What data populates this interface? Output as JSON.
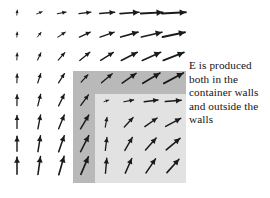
{
  "figure": {
    "name": "electric-field-container-diagram",
    "width": 270,
    "height": 198,
    "background_color": "#ffffff"
  },
  "annotation": {
    "lines": [
      "E is produced",
      "both in the",
      "container walls",
      "and outside the",
      "walls"
    ],
    "full_text": "E is produced both in the container walls and outside the walls",
    "color": "#141414",
    "x": 189,
    "y": 59
  },
  "container": {
    "wall_color": "#b9b9b9",
    "interior_color": "#e2e2e2",
    "wall_rect": {
      "x": 73,
      "y": 71,
      "width": 113,
      "height": 112
    },
    "interior_rect": {
      "x": 95,
      "y": 94,
      "width": 91,
      "height": 89
    },
    "wall_thickness": 22
  },
  "chart_data": {
    "type": "quiver",
    "title": "",
    "xlabel": "",
    "ylabel": "",
    "grid": false,
    "legend": null,
    "arrow_color": "#1a1a1a",
    "source_origin": {
      "x": 13,
      "y": 2,
      "note": "field radiates from point charge near upper-left corner"
    },
    "grid_spacing": {
      "dx": 22.2,
      "dy": 22.2
    },
    "grid_origin": {
      "x": 17,
      "y": 13
    },
    "columns": 8,
    "rows": 8,
    "xlim": [
      0,
      270
    ],
    "ylim": [
      0,
      198
    ],
    "arrows": [
      {
        "col": 0,
        "row": 0,
        "x": 17,
        "y": 13,
        "angle_deg": -84,
        "length": 5
      },
      {
        "col": 1,
        "row": 0,
        "x": 39,
        "y": 13,
        "angle_deg": -22,
        "length": 6
      },
      {
        "col": 2,
        "row": 0,
        "x": 61,
        "y": 13,
        "angle_deg": -11,
        "length": 9
      },
      {
        "col": 3,
        "row": 0,
        "x": 84,
        "y": 13,
        "angle_deg": -7,
        "length": 12
      },
      {
        "col": 4,
        "row": 0,
        "x": 106,
        "y": 13,
        "angle_deg": -5,
        "length": 15
      },
      {
        "col": 5,
        "row": 0,
        "x": 128,
        "y": 13,
        "angle_deg": -4,
        "length": 19
      },
      {
        "col": 6,
        "row": 0,
        "x": 150,
        "y": 13,
        "angle_deg": -3,
        "length": 22
      },
      {
        "col": 7,
        "row": 0,
        "x": 172,
        "y": 13,
        "angle_deg": -3,
        "length": 24
      },
      {
        "col": 0,
        "row": 1,
        "x": 17,
        "y": 35,
        "angle_deg": -86,
        "length": 5
      },
      {
        "col": 1,
        "row": 1,
        "x": 39,
        "y": 35,
        "angle_deg": -52,
        "length": 6
      },
      {
        "col": 2,
        "row": 1,
        "x": 61,
        "y": 35,
        "angle_deg": -34,
        "length": 9
      },
      {
        "col": 3,
        "row": 1,
        "x": 84,
        "y": 35,
        "angle_deg": -25,
        "length": 12
      },
      {
        "col": 4,
        "row": 1,
        "x": 106,
        "y": 35,
        "angle_deg": -19,
        "length": 15
      },
      {
        "col": 5,
        "row": 1,
        "x": 128,
        "y": 35,
        "angle_deg": -16,
        "length": 18
      },
      {
        "col": 6,
        "row": 1,
        "x": 150,
        "y": 35,
        "angle_deg": -13,
        "length": 21
      },
      {
        "col": 7,
        "row": 1,
        "x": 172,
        "y": 35,
        "angle_deg": -12,
        "length": 23
      },
      {
        "col": 0,
        "row": 2,
        "x": 17,
        "y": 57,
        "angle_deg": -87,
        "length": 7
      },
      {
        "col": 1,
        "row": 2,
        "x": 39,
        "y": 57,
        "angle_deg": -65,
        "length": 8
      },
      {
        "col": 2,
        "row": 2,
        "x": 61,
        "y": 57,
        "angle_deg": -49,
        "length": 10
      },
      {
        "col": 3,
        "row": 2,
        "x": 84,
        "y": 57,
        "angle_deg": -39,
        "length": 13
      },
      {
        "col": 4,
        "row": 2,
        "x": 106,
        "y": 57,
        "angle_deg": -32,
        "length": 15
      },
      {
        "col": 5,
        "row": 2,
        "x": 128,
        "y": 57,
        "angle_deg": -27,
        "length": 18
      },
      {
        "col": 6,
        "row": 2,
        "x": 150,
        "y": 57,
        "angle_deg": -24,
        "length": 20
      },
      {
        "col": 7,
        "row": 2,
        "x": 172,
        "y": 57,
        "angle_deg": -21,
        "length": 22
      },
      {
        "col": 0,
        "row": 3,
        "x": 17,
        "y": 79,
        "angle_deg": -88,
        "length": 9
      },
      {
        "col": 1,
        "row": 3,
        "x": 39,
        "y": 79,
        "angle_deg": -72,
        "length": 10
      },
      {
        "col": 2,
        "row": 3,
        "x": 61,
        "y": 79,
        "angle_deg": -58,
        "length": 11
      },
      {
        "col": 3,
        "row": 3,
        "x": 84,
        "y": 79,
        "angle_deg": -47,
        "length": 10
      },
      {
        "col": 4,
        "row": 3,
        "x": 106,
        "y": 79,
        "angle_deg": -40,
        "length": 14
      },
      {
        "col": 5,
        "row": 3,
        "x": 128,
        "y": 79,
        "angle_deg": -35,
        "length": 17
      },
      {
        "col": 6,
        "row": 3,
        "x": 150,
        "y": 79,
        "angle_deg": -31,
        "length": 20
      },
      {
        "col": 7,
        "row": 3,
        "x": 172,
        "y": 79,
        "angle_deg": -28,
        "length": 22
      },
      {
        "col": 0,
        "row": 4,
        "x": 17,
        "y": 101,
        "angle_deg": -89,
        "length": 11
      },
      {
        "col": 1,
        "row": 4,
        "x": 39,
        "y": 101,
        "angle_deg": -76,
        "length": 12
      },
      {
        "col": 2,
        "row": 4,
        "x": 61,
        "y": 101,
        "angle_deg": -64,
        "length": 13
      },
      {
        "col": 3,
        "row": 4,
        "x": 84,
        "y": 101,
        "angle_deg": -54,
        "length": 13
      },
      {
        "col": 4,
        "row": 4,
        "x": 106,
        "y": 101,
        "angle_deg": -18,
        "length": 5
      },
      {
        "col": 5,
        "row": 4,
        "x": 128,
        "y": 101,
        "angle_deg": -11,
        "length": 10
      },
      {
        "col": 6,
        "row": 4,
        "x": 150,
        "y": 101,
        "angle_deg": -7,
        "length": 14
      },
      {
        "col": 7,
        "row": 4,
        "x": 172,
        "y": 101,
        "angle_deg": -5,
        "length": 16
      },
      {
        "col": 0,
        "row": 5,
        "x": 17,
        "y": 123,
        "angle_deg": -90,
        "length": 13
      },
      {
        "col": 1,
        "row": 5,
        "x": 39,
        "y": 123,
        "angle_deg": -79,
        "length": 14
      },
      {
        "col": 2,
        "row": 5,
        "x": 61,
        "y": 123,
        "angle_deg": -68,
        "length": 15
      },
      {
        "col": 3,
        "row": 5,
        "x": 84,
        "y": 123,
        "angle_deg": -59,
        "length": 16
      },
      {
        "col": 4,
        "row": 5,
        "x": 106,
        "y": 123,
        "angle_deg": -80,
        "length": 10
      },
      {
        "col": 5,
        "row": 5,
        "x": 128,
        "y": 123,
        "angle_deg": -47,
        "length": 13
      },
      {
        "col": 6,
        "row": 5,
        "x": 150,
        "y": 123,
        "angle_deg": -35,
        "length": 15
      },
      {
        "col": 7,
        "row": 5,
        "x": 172,
        "y": 123,
        "angle_deg": -28,
        "length": 17
      },
      {
        "col": 0,
        "row": 6,
        "x": 17,
        "y": 145,
        "angle_deg": -90,
        "length": 15
      },
      {
        "col": 1,
        "row": 6,
        "x": 39,
        "y": 145,
        "angle_deg": -81,
        "length": 16
      },
      {
        "col": 2,
        "row": 6,
        "x": 61,
        "y": 145,
        "angle_deg": -71,
        "length": 17
      },
      {
        "col": 3,
        "row": 6,
        "x": 84,
        "y": 145,
        "angle_deg": -63,
        "length": 18
      },
      {
        "col": 4,
        "row": 6,
        "x": 106,
        "y": 145,
        "angle_deg": -83,
        "length": 13
      },
      {
        "col": 5,
        "row": 6,
        "x": 128,
        "y": 145,
        "angle_deg": -60,
        "length": 15
      },
      {
        "col": 6,
        "row": 6,
        "x": 150,
        "y": 145,
        "angle_deg": -48,
        "length": 16
      },
      {
        "col": 7,
        "row": 6,
        "x": 172,
        "y": 145,
        "angle_deg": -40,
        "length": 18
      },
      {
        "col": 0,
        "row": 7,
        "x": 17,
        "y": 167,
        "angle_deg": -90,
        "length": 17
      },
      {
        "col": 1,
        "row": 7,
        "x": 39,
        "y": 167,
        "angle_deg": -82,
        "length": 18
      },
      {
        "col": 2,
        "row": 7,
        "x": 61,
        "y": 167,
        "angle_deg": -74,
        "length": 19
      },
      {
        "col": 3,
        "row": 7,
        "x": 84,
        "y": 167,
        "angle_deg": -67,
        "length": 19
      },
      {
        "col": 4,
        "row": 7,
        "x": 106,
        "y": 167,
        "angle_deg": -85,
        "length": 15
      },
      {
        "col": 5,
        "row": 7,
        "x": 128,
        "y": 167,
        "angle_deg": -66,
        "length": 16
      },
      {
        "col": 6,
        "row": 7,
        "x": 150,
        "y": 167,
        "angle_deg": -56,
        "length": 17
      },
      {
        "col": 7,
        "row": 7,
        "x": 172,
        "y": 167,
        "angle_deg": -48,
        "length": 18
      }
    ]
  }
}
